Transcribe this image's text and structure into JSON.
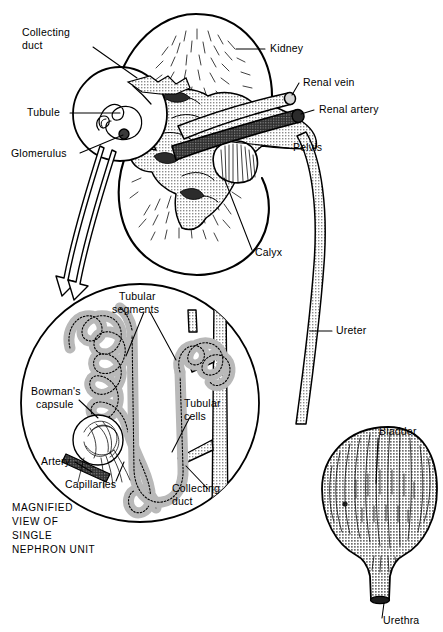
{
  "figure": {
    "caption_lines": [
      "MAGNIFIED",
      "VIEW OF",
      "SINGLE",
      "NEPHRON UNIT"
    ],
    "colors": {
      "ink": "#000000",
      "paper": "#ffffff",
      "artery_fill": "#4a4a4a",
      "vein_fill": "#9a9a9a",
      "pelvis_fill": "#b8b8b8",
      "tubule_fill": "#bdbdbd",
      "bladder_fill": "#b0b0b0"
    }
  },
  "kidney_view": {
    "labels": [
      {
        "id": "collecting-duct",
        "text_lines": [
          "Collecting",
          "duct"
        ],
        "x": 22,
        "y": 36
      },
      {
        "id": "tubule",
        "text_lines": [
          "Tubule"
        ],
        "x": 27,
        "y": 116
      },
      {
        "id": "glomerulus",
        "text_lines": [
          "Glomerulus"
        ],
        "x": 11,
        "y": 157
      },
      {
        "id": "kidney",
        "text_lines": [
          "Kidney"
        ],
        "x": 270,
        "y": 52
      },
      {
        "id": "renal-vein",
        "text_lines": [
          "Renal vein"
        ],
        "x": 303,
        "y": 86
      },
      {
        "id": "renal-artery",
        "text_lines": [
          "Renal artery"
        ],
        "x": 319,
        "y": 113
      },
      {
        "id": "pelvis",
        "text_lines": [
          "Pelvis"
        ],
        "x": 293,
        "y": 151
      },
      {
        "id": "calyx",
        "text_lines": [
          "Calyx"
        ],
        "x": 255,
        "y": 256
      },
      {
        "id": "ureter",
        "text_lines": [
          "Ureter"
        ],
        "x": 336,
        "y": 334
      }
    ]
  },
  "nephron_view": {
    "labels": [
      {
        "id": "tubular-segments",
        "text_lines": [
          "Tubular",
          "segments"
        ],
        "x": 116,
        "y": 300
      },
      {
        "id": "bowmans-capsule",
        "text_lines": [
          "Bowman's",
          "capsule"
        ],
        "x": 31,
        "y": 395
      },
      {
        "id": "tubular-cells",
        "text_lines": [
          "Tubular",
          "cells"
        ],
        "x": 184,
        "y": 407
      },
      {
        "id": "artery",
        "text_lines": [
          "Artery"
        ],
        "x": 41,
        "y": 465
      },
      {
        "id": "capillaries",
        "text_lines": [
          "Capillaries"
        ],
        "x": 65,
        "y": 488
      },
      {
        "id": "collecting-duct-inset",
        "text_lines": [
          "Collecting",
          "duct"
        ],
        "x": 176,
        "y": 492
      }
    ]
  },
  "bladder_view": {
    "labels": [
      {
        "id": "bladder",
        "text_lines": [
          "Bladder"
        ],
        "x": 379,
        "y": 435
      },
      {
        "id": "urethra",
        "text_lines": [
          "Urethra"
        ],
        "x": 383,
        "y": 624
      }
    ]
  }
}
